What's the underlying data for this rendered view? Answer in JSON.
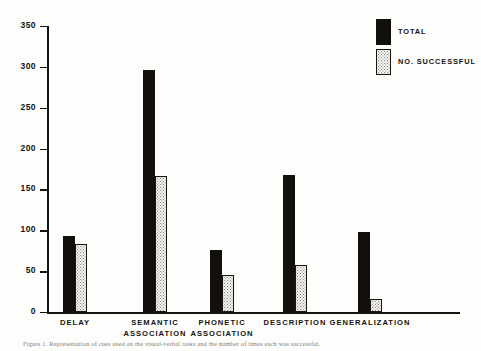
{
  "figure": {
    "caption": "Figure 1.  Representation of cues used on the visual-verbal tasks and the number of times each was successful."
  },
  "legend": {
    "position": "top-right",
    "entries": [
      {
        "label": "TOTAL",
        "swatch": "solid-black-swatch",
        "color": "#120f0c"
      },
      {
        "label": "NO. SUCCESSFUL",
        "swatch": "stippled-white-swatch",
        "color": "#f4f3ef"
      }
    ]
  },
  "axes": {
    "y_ticks": [
      "0",
      "50",
      "100",
      "150",
      "200",
      "250",
      "300",
      "350"
    ],
    "x_labels": [
      "DELAY",
      "SEMANTIC\nASSOCIATION",
      "PHONETIC\nASSOCIATION",
      "DESCRIPTION",
      "GENERALIZATION"
    ]
  },
  "chart_data": {
    "type": "bar",
    "title": "",
    "xlabel": "",
    "ylabel": "",
    "ylim": [
      0,
      350
    ],
    "yticks": [
      0,
      50,
      100,
      150,
      200,
      250,
      300,
      350
    ],
    "grid": false,
    "legend_position": "upper right",
    "categories": [
      "DELAY",
      "SEMANTIC ASSOCIATION",
      "PHONETIC ASSOCIATION",
      "DESCRIPTION",
      "GENERALIZATION"
    ],
    "series": [
      {
        "name": "TOTAL",
        "values": [
          93,
          296,
          76,
          168,
          98
        ]
      },
      {
        "name": "NO. SUCCESSFUL",
        "values": [
          83,
          166,
          45,
          58,
          16
        ]
      }
    ]
  }
}
